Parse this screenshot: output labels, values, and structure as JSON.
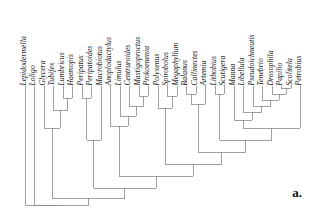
{
  "figure": {
    "panel_label": "a.",
    "type": "cladogram",
    "line_color": "#8a8a8a",
    "text_color": "#111111",
    "background": "#ffffff"
  },
  "taxa": [
    {
      "name": "Lepidodermella",
      "x": 25
    },
    {
      "name": "Loligo",
      "x": 34
    },
    {
      "name": "Glycera",
      "x": 44
    },
    {
      "name": "Tubifex",
      "x": 53
    },
    {
      "name": "Lumbricus",
      "x": 63
    },
    {
      "name": "Haemopis",
      "x": 72
    },
    {
      "name": "Peripatus",
      "x": 82
    },
    {
      "name": "Peripatoides",
      "x": 91
    },
    {
      "name": "Macrobiotus",
      "x": 101
    },
    {
      "name": "Anoplodactylus",
      "x": 110
    },
    {
      "name": "Limulus",
      "x": 120
    },
    {
      "name": "Centruroides",
      "x": 129
    },
    {
      "name": "Mastigoproctus",
      "x": 139
    },
    {
      "name": "Prokoenenia",
      "x": 148
    },
    {
      "name": "Polyxenus",
      "x": 158
    },
    {
      "name": "Spirobolus",
      "x": 167
    },
    {
      "name": "Megaphyllum",
      "x": 177
    },
    {
      "name": "Balanus",
      "x": 186
    },
    {
      "name": "Callinectes",
      "x": 196
    },
    {
      "name": "Artemia",
      "x": 205
    },
    {
      "name": "Lithobius",
      "x": 215
    },
    {
      "name": "Scutigera",
      "x": 224
    },
    {
      "name": "Manna",
      "x": 234
    },
    {
      "name": "Libellula",
      "x": 243
    },
    {
      "name": "Pseudoichneutis",
      "x": 253
    },
    {
      "name": "Tenebrio",
      "x": 262
    },
    {
      "name": "Drosophila",
      "x": 272
    },
    {
      "name": "Papilio",
      "x": 281
    },
    {
      "name": "Scolitela",
      "x": 291
    },
    {
      "name": "Petrobius",
      "x": 300
    }
  ],
  "chart_data": {
    "type": "tree",
    "title": "",
    "tip_count": 30,
    "tip_labels": [
      "Lepidodermella",
      "Loligo",
      "Glycera",
      "Tubifex",
      "Lumbricus",
      "Haemopis",
      "Peripatus",
      "Peripatoides",
      "Macrobiotus",
      "Anoplodactylus",
      "Limulus",
      "Centruroides",
      "Mastigoproctus",
      "Prokoenenia",
      "Polyxenus",
      "Spirobolus",
      "Megaphyllum",
      "Balanus",
      "Callinectes",
      "Artemia",
      "Lithobius",
      "Scutigera",
      "Manna",
      "Libellula",
      "Pseudoichneutis",
      "Tenebrio",
      "Drosophila",
      "Papilio",
      "Scolitela",
      "Petrobius"
    ],
    "orientation": "tips-up",
    "root_x": 25,
    "root_y": 205,
    "tip_y": 86,
    "nodes": [
      {
        "id": "n_lumbricus_haemopis",
        "children_x": [
          63,
          72
        ],
        "y": 98
      },
      {
        "id": "n_tubifex_clade",
        "children_x": [
          53,
          67.5
        ],
        "y": 110
      },
      {
        "id": "n_annelida",
        "children_x": [
          44,
          60.25
        ],
        "y": 128
      },
      {
        "id": "n_peripatus_peripatoides",
        "children_x": [
          82,
          91
        ],
        "y": 98
      },
      {
        "id": "n_onychophora_tardigrada",
        "children_x": [
          86.5,
          101
        ],
        "y": 140
      },
      {
        "id": "n_mastigo_prokoenenia",
        "children_x": [
          139,
          148
        ],
        "y": 96
      },
      {
        "id": "n_centruroides_clade",
        "children_x": [
          129,
          143.5
        ],
        "y": 106
      },
      {
        "id": "n_limulus_clade",
        "children_x": [
          120,
          136.25
        ],
        "y": 116
      },
      {
        "id": "n_chelicerata",
        "children_x": [
          110,
          128.1
        ],
        "y": 126
      },
      {
        "id": "n_spirobolus_megaphyllum",
        "children_x": [
          167,
          177
        ],
        "y": 96
      },
      {
        "id": "n_diplopoda",
        "children_x": [
          158,
          172
        ],
        "y": 108
      },
      {
        "id": "n_balanus_callinectes",
        "children_x": [
          186,
          196
        ],
        "y": 94
      },
      {
        "id": "n_crustacea",
        "children_x": [
          191,
          205
        ],
        "y": 104
      },
      {
        "id": "n_lithobius_scutigera",
        "children_x": [
          215,
          224
        ],
        "y": 94
      },
      {
        "id": "n_papilio_scolitela",
        "children_x": [
          281,
          291
        ],
        "y": 88
      },
      {
        "id": "n_drosophila_clade",
        "children_x": [
          272,
          286
        ],
        "y": 94
      },
      {
        "id": "n_tenebrio_clade",
        "children_x": [
          262,
          279
        ],
        "y": 100
      },
      {
        "id": "n_pseudo_clade",
        "children_x": [
          253,
          270.5
        ],
        "y": 106
      },
      {
        "id": "n_libellula_clade",
        "children_x": [
          243,
          261.75
        ],
        "y": 112
      },
      {
        "id": "n_pterygota",
        "children_x": [
          234,
          252.4
        ],
        "y": 120
      },
      {
        "id": "n_insecta",
        "children_x": [
          243.2,
          300
        ],
        "y": 128
      },
      {
        "id": "n_myriapoda_insecta",
        "children_x": [
          219.5,
          271.6
        ],
        "y": 140
      },
      {
        "id": "n_pancrustacea",
        "children_x": [
          198,
          245.5
        ],
        "y": 152
      },
      {
        "id": "n_mandibulata",
        "children_x": [
          165,
          221.8
        ],
        "y": 164
      },
      {
        "id": "n_arthropoda",
        "children_x": [
          119,
          193.4
        ],
        "y": 176
      },
      {
        "id": "n_panarthropoda",
        "children_x": [
          93.75,
          156.2
        ],
        "y": 188
      },
      {
        "id": "n_ecdysozoa_lophotrochozoa",
        "children_x": [
          52.1,
          124.9
        ],
        "y": 198
      },
      {
        "id": "n_root",
        "children_x": [
          34,
          88.5
        ],
        "y": 205
      },
      {
        "id": "n_outgroup",
        "children_x": [
          25,
          61.25
        ],
        "y": 205
      }
    ]
  }
}
